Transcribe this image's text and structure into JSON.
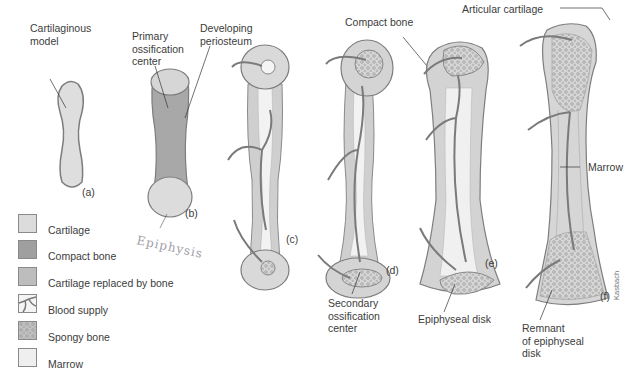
{
  "figure": {
    "stages": [
      {
        "id": "a",
        "label": "(a)"
      },
      {
        "id": "b",
        "label": "(b)"
      },
      {
        "id": "c",
        "label": "(c)"
      },
      {
        "id": "d",
        "label": "(d)"
      },
      {
        "id": "e",
        "label": "(e)"
      },
      {
        "id": "f",
        "label": "(f)"
      }
    ],
    "callouts": {
      "cartilaginous_model": [
        "Cartilaginous",
        "model"
      ],
      "primary_ossification": [
        "Primary",
        "ossification",
        "center"
      ],
      "developing_periosteum": [
        "Developing",
        "periosteum"
      ],
      "compact_bone": "Compact bone",
      "secondary_ossification": [
        "Secondary",
        "ossification",
        "center"
      ],
      "epiphyseal_disk": "Epiphyseal disk",
      "articular_cartilage": "Articular cartilage",
      "marrow": "Marrow",
      "remnant": [
        "Remnant",
        "of epiphyseal",
        "disk"
      ]
    },
    "handwritten_note": "Epiphysis",
    "artist_signature": "Kasbach",
    "colors": {
      "cartilage": "#dcdcdc",
      "compact_bone": "#9a9a9a",
      "replaced": "#bdbdbd",
      "blood": "#7a7a7a",
      "spongy": "#c8c8c8",
      "marrow": "#ececec",
      "outline": "#7d7d7d"
    }
  },
  "legend": {
    "items": [
      {
        "label": "Cartilage",
        "icon": "cartilage-swatch"
      },
      {
        "label": "Compact bone",
        "icon": "compact-bone-swatch"
      },
      {
        "label": "Cartilage replaced by bone",
        "icon": "replaced-swatch"
      },
      {
        "label": "Blood supply",
        "icon": "blood-supply-swatch"
      },
      {
        "label": "Spongy bone",
        "icon": "spongy-bone-swatch"
      },
      {
        "label": "Marrow",
        "icon": "marrow-swatch"
      }
    ]
  }
}
